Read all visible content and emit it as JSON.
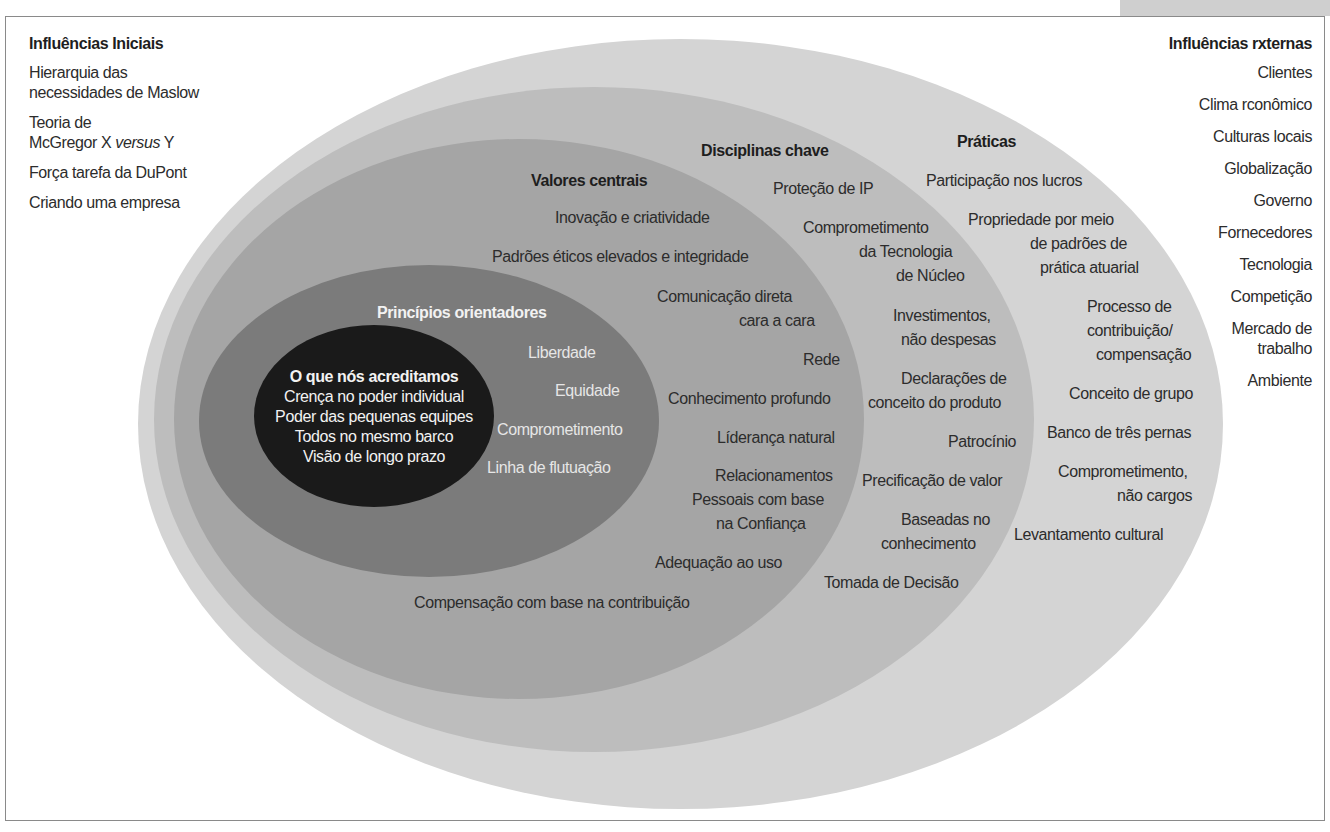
{
  "left_column": {
    "title": "Influências Iniciais",
    "items": [
      "Hierarquia das\nnecessidades de Maslow",
      "Teoria de\nMcGregor X versus Y",
      "Força tarefa da DuPont",
      "Criando uma empresa"
    ],
    "item1_line1": "Hierarquia das",
    "item1_line2": "necessidades de Maslow",
    "item2_line1": "Teoria de",
    "item2_line2_pre": "McGregor X ",
    "item2_line2_italic": "versus",
    "item2_line2_post": " Y",
    "item3": "Força tarefa da DuPont",
    "item4": "Criando uma empresa"
  },
  "right_column": {
    "title": "Influências rxternas",
    "items": [
      "Clientes",
      "Clima rconômico",
      "Culturas locais",
      "Globalização",
      "Governo",
      "Fornecedores",
      "Tecnologia",
      "Competição",
      "Mercado de\ntrabalho",
      "Ambiente"
    ],
    "mercado_line1": "Mercado de",
    "mercado_line2": "trabalho"
  },
  "core": {
    "title": "O que nós acreditamos",
    "items": [
      "Crença no poder individual",
      "Poder das pequenas equipes",
      "Todos no mesmo barco",
      "Visão de longo prazo"
    ]
  },
  "principios": {
    "title": "Princípios orientadores",
    "items": [
      "Liberdade",
      "Equidade",
      "Comprometimento",
      "Linha de flutuação"
    ]
  },
  "valores": {
    "title": "Valores centrais",
    "items": [
      "Inovação e criatividade",
      "Padrões éticos elevados e integridade",
      "Comunicação direta",
      "cara a cara",
      "Rede",
      "Conhecimento profundo",
      "Líderança natural",
      "Relacionamentos",
      "Pessoais com base",
      "na Confiança",
      "Adequação ao uso",
      "Compensação com base na contribuição"
    ]
  },
  "disciplinas": {
    "title": "Disciplinas chave",
    "items": [
      "Proteção de IP",
      "Comprometimento",
      "da Tecnologia",
      "de Núcleo",
      "Investimentos,",
      "não despesas",
      "Declarações de",
      "conceito do produto",
      "Patrocínio",
      "Precificação de valor",
      "Baseadas no",
      "conhecimento",
      "Tomada de Decisão"
    ]
  },
  "praticas": {
    "title": "Práticas",
    "items": [
      "Participação nos lucros",
      "Propriedade por meio",
      "de padrões de",
      "prática atuarial",
      "Processo de",
      "contribuição/",
      "compensação",
      "Conceito de grupo",
      "Banco de três pernas",
      "Comprometimento,",
      "não cargos",
      "Levantamento cultural"
    ]
  },
  "colors": {
    "outer_praticas": "#d4d4d4",
    "disciplinas": "#bdbdbd",
    "valores": "#a5a5a5",
    "principios": "#7b7b7b",
    "core": "#1a1a1a"
  }
}
